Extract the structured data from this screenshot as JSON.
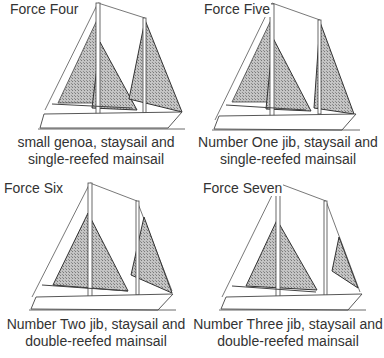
{
  "panels": [
    {
      "title": "Force Four",
      "caption_line1": "small genoa, staysail and",
      "caption_line2": "single-reefed mainsail"
    },
    {
      "title": "Force Five",
      "caption_line1": "Number One jib, staysail and",
      "caption_line2": "single-reefed mainsail"
    },
    {
      "title": "Force Six",
      "caption_line1": "Number Two jib, staysail and",
      "caption_line2": "double-reefed mainsail"
    },
    {
      "title": "Force Seven",
      "caption_line1": "Number Three jib, staysail and",
      "caption_line2": "double-reefed mainsail"
    }
  ],
  "colors": {
    "sail_fill": "#a8a8a8",
    "line": "#444444",
    "text": "#333333"
  }
}
